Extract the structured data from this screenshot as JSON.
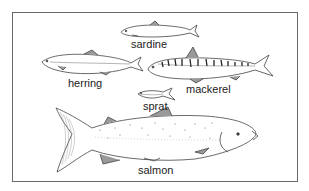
{
  "figure": {
    "fish": [
      {
        "id": "sardine",
        "label": "sardine"
      },
      {
        "id": "herring",
        "label": "herring"
      },
      {
        "id": "mackerel",
        "label": "mackerel"
      },
      {
        "id": "sprat",
        "label": "sprat"
      },
      {
        "id": "salmon",
        "label": "salmon"
      }
    ]
  },
  "colors": {
    "line": "#444444",
    "fin": "#9a9a9a",
    "border": "#6a6a6a"
  }
}
